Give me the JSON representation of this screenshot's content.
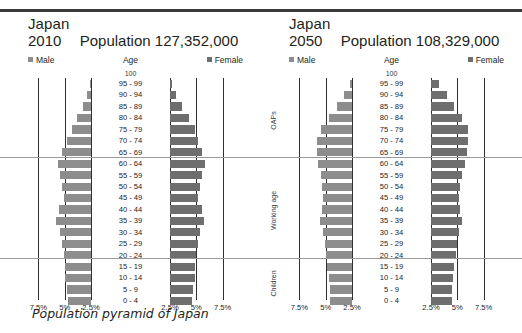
{
  "caption": "Population pyramid of Japan",
  "colors": {
    "male": "#8d8d8d",
    "female": "#6e6e6e",
    "gridline": "#2f2f2f",
    "divider": "#9a9a9a",
    "rule": "#3b3b3b",
    "text": "#231f20"
  },
  "axis": {
    "ticks_left": [
      "7.5%",
      "5%",
      "2.5%"
    ],
    "ticks_right": [
      "2.5%",
      "5%",
      "7.5%"
    ],
    "max_percent": 10,
    "grid_percents": [
      7.5,
      5,
      2.5
    ]
  },
  "band_labels": [
    "OAPs",
    "Working age",
    "Children"
  ],
  "legend": {
    "male": "Male",
    "female": "Female"
  },
  "headers": {
    "age": "Age",
    "top_age": "100",
    "population_word": "Population"
  },
  "age_groups": [
    "95 - 99",
    "90 - 94",
    "85 - 89",
    "80 - 84",
    "75 - 79",
    "70 - 74",
    "65 - 69",
    "60 - 64",
    "55 - 59",
    "50 - 54",
    "45 - 49",
    "40 - 44",
    "35 - 39",
    "30 - 34",
    "25 - 29",
    "20 - 24",
    "15 - 19",
    "10 - 14",
    "5 - 9",
    "0 - 4"
  ],
  "panels": [
    {
      "country": "Japan",
      "year": "2010",
      "population": "127,352,000",
      "title": "Population 127,352,000",
      "chart_data": {
        "type": "bar",
        "orientation": "horizontal-diverging",
        "title": "Japan 2010 Population 127,352,000",
        "xlabel": "",
        "ylabel": "Age",
        "xlim": [
          -10,
          10
        ],
        "categories": [
          "95 - 99",
          "90 - 94",
          "85 - 89",
          "80 - 84",
          "75 - 79",
          "70 - 74",
          "65 - 69",
          "60 - 64",
          "55 - 59",
          "50 - 54",
          "45 - 49",
          "40 - 44",
          "35 - 39",
          "30 - 34",
          "25 - 29",
          "20 - 24",
          "15 - 19",
          "10 - 14",
          "5 - 9",
          "0 - 4"
        ],
        "series": [
          {
            "name": "Male",
            "values": [
              0.1,
              0.35,
              0.75,
              1.3,
              1.8,
              2.3,
              2.75,
              3.1,
              2.9,
              2.75,
              2.6,
              3.0,
              3.3,
              2.9,
              2.75,
              2.6,
              2.5,
              2.45,
              2.3,
              2.2
            ]
          },
          {
            "name": "Female",
            "values": [
              0.2,
              0.6,
              1.1,
              1.8,
              2.35,
              2.7,
              3.0,
              3.3,
              3.05,
              2.85,
              2.65,
              3.0,
              3.2,
              2.85,
              2.7,
              2.5,
              2.4,
              2.35,
              2.2,
              2.1
            ]
          }
        ],
        "legend_position": "top",
        "grid": true,
        "bands": [
          {
            "label": "OAPs",
            "from": "65 - 69",
            "to": "95 - 99"
          },
          {
            "label": "Working age",
            "from": "15 - 19",
            "to": "60 - 64"
          },
          {
            "label": "Children",
            "from": "0 - 4",
            "to": "10 - 14"
          }
        ]
      }
    },
    {
      "country": "Japan",
      "year": "2050",
      "population": "108,329,000",
      "title": "Population 108,329,000",
      "chart_data": {
        "type": "bar",
        "orientation": "horizontal-diverging",
        "title": "Japan 2050 Population 108,329,000",
        "xlabel": "",
        "ylabel": "Age",
        "xlim": [
          -10,
          10
        ],
        "categories": [
          "95 - 99",
          "90 - 94",
          "85 - 89",
          "80 - 84",
          "75 - 79",
          "70 - 74",
          "65 - 69",
          "60 - 64",
          "55 - 59",
          "50 - 54",
          "45 - 49",
          "40 - 44",
          "35 - 39",
          "30 - 34",
          "25 - 29",
          "20 - 24",
          "15 - 19",
          "10 - 14",
          "5 - 9",
          "0 - 4"
        ],
        "series": [
          {
            "name": "Male",
            "values": [
              0.2,
              0.75,
              1.4,
              2.15,
              2.9,
              3.3,
              3.35,
              3.2,
              2.95,
              2.85,
              2.8,
              2.85,
              3.0,
              2.8,
              2.6,
              2.45,
              2.35,
              2.2,
              2.1,
              2.05
            ]
          },
          {
            "name": "Female",
            "values": [
              0.8,
              1.5,
              2.2,
              2.95,
              3.5,
              3.5,
              3.4,
              3.2,
              2.9,
              2.8,
              2.7,
              2.8,
              2.9,
              2.7,
              2.5,
              2.35,
              2.2,
              2.1,
              2.0,
              1.95
            ]
          }
        ],
        "legend_position": "top",
        "grid": true,
        "bands": [
          {
            "label": "OAPs",
            "from": "65 - 69",
            "to": "95 - 99"
          },
          {
            "label": "Working age",
            "from": "15 - 19",
            "to": "60 - 64"
          },
          {
            "label": "Children",
            "from": "0 - 4",
            "to": "10 - 14"
          }
        ]
      }
    }
  ]
}
